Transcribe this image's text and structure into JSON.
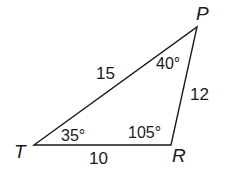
{
  "diagram": {
    "type": "triangle",
    "vertices": {
      "T": {
        "label": "T"
      },
      "R": {
        "label": "R"
      },
      "P": {
        "label": "P"
      }
    },
    "sides": {
      "TP": "15",
      "PR": "12",
      "TR": "10"
    },
    "angles": {
      "T": "35°",
      "P": "40°",
      "R": "105°"
    },
    "stroke_color": "#1a1a1a"
  }
}
